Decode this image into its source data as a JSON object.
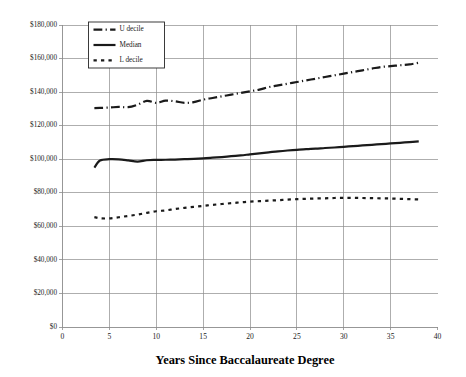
{
  "chart_data": {
    "type": "line",
    "title": "",
    "xlabel": "Years Since Baccalaureate Degree",
    "ylabel": "",
    "xlim": [
      0,
      40
    ],
    "ylim": [
      0,
      180000
    ],
    "grid": true,
    "legend_position": "top-left-inside",
    "x_ticks": [
      "0",
      "5",
      "10",
      "15",
      "20",
      "25",
      "30",
      "35",
      "40"
    ],
    "x_tick_values": [
      0,
      5,
      10,
      15,
      20,
      25,
      30,
      35,
      40
    ],
    "y_ticks": [
      "$0",
      "$20,000",
      "$40,000",
      "$60,000",
      "$80,000",
      "$100,000",
      "$120,000",
      "$140,000",
      "$160,000",
      "$180,000"
    ],
    "y_tick_values": [
      0,
      20000,
      40000,
      60000,
      80000,
      100000,
      120000,
      140000,
      160000,
      180000
    ],
    "series": [
      {
        "name": "U decile",
        "style": "dash-dot",
        "width": 2.2,
        "color": "#1a1a1a",
        "x": [
          3.4,
          4.0,
          5.0,
          6.0,
          7.0,
          8.0,
          9.0,
          10.0,
          11.0,
          12.0,
          13.0,
          14.0,
          15.0,
          16.0,
          17.0,
          18.0,
          19.0,
          20.0,
          21.0,
          22.0,
          23.0,
          24.0,
          25.0,
          26.0,
          27.0,
          28.0,
          29.0,
          30.0,
          31.0,
          32.0,
          33.0,
          34.0,
          35.0,
          36.0,
          37.0,
          38.0
        ],
        "values": [
          130500,
          130600,
          130800,
          131200,
          131000,
          132500,
          134800,
          133600,
          134900,
          134500,
          133600,
          134000,
          135500,
          136500,
          137500,
          138500,
          139500,
          140500,
          141500,
          143000,
          144000,
          145000,
          146000,
          147000,
          148000,
          149000,
          150000,
          151000,
          152000,
          153000,
          154000,
          155000,
          155500,
          156000,
          156500,
          157500
        ]
      },
      {
        "name": "Median",
        "style": "solid",
        "width": 2.2,
        "color": "#1a1a1a",
        "x": [
          3.4,
          4.0,
          5.0,
          6.0,
          7.0,
          8.0,
          9.0,
          10.0,
          11.0,
          12.0,
          13.0,
          14.0,
          15.0,
          16.0,
          17.0,
          18.0,
          19.0,
          20.0,
          21.0,
          22.0,
          23.0,
          24.0,
          25.0,
          26.0,
          27.0,
          28.0,
          29.0,
          30.0,
          31.0,
          32.0,
          33.0,
          34.0,
          35.0,
          36.0,
          37.0,
          38.0
        ],
        "values": [
          95000,
          99200,
          100000,
          99900,
          99300,
          98600,
          99400,
          99600,
          99700,
          99800,
          100000,
          100200,
          100500,
          100900,
          101300,
          101800,
          102300,
          102900,
          103500,
          104100,
          104700,
          105200,
          105600,
          106000,
          106300,
          106700,
          107000,
          107400,
          107800,
          108200,
          108600,
          109000,
          109400,
          109800,
          110200,
          110600
        ]
      },
      {
        "name": "L decile",
        "style": "dotted",
        "width": 2.2,
        "color": "#1a1a1a",
        "x": [
          3.4,
          4.0,
          5.0,
          6.0,
          7.0,
          8.0,
          9.0,
          10.0,
          11.0,
          12.0,
          13.0,
          14.0,
          15.0,
          16.0,
          17.0,
          18.0,
          19.0,
          20.0,
          21.0,
          22.0,
          23.0,
          24.0,
          25.0,
          26.0,
          27.0,
          28.0,
          29.0,
          30.0,
          31.0,
          32.0,
          33.0,
          34.0,
          35.0,
          36.0,
          37.0,
          38.0
        ],
        "values": [
          65500,
          64800,
          64700,
          65400,
          66200,
          67000,
          68000,
          69000,
          69500,
          70300,
          71000,
          71600,
          72200,
          72800,
          73300,
          73800,
          74300,
          74700,
          75000,
          75300,
          75600,
          75900,
          76200,
          76400,
          76600,
          76700,
          76900,
          77000,
          77000,
          76900,
          76800,
          76700,
          76600,
          76400,
          76200,
          76000
        ]
      }
    ],
    "legend_entries": [
      {
        "label": "U decile",
        "style": "dash-dot"
      },
      {
        "label": "Median",
        "style": "solid"
      },
      {
        "label": "L decile",
        "style": "dotted"
      }
    ]
  }
}
